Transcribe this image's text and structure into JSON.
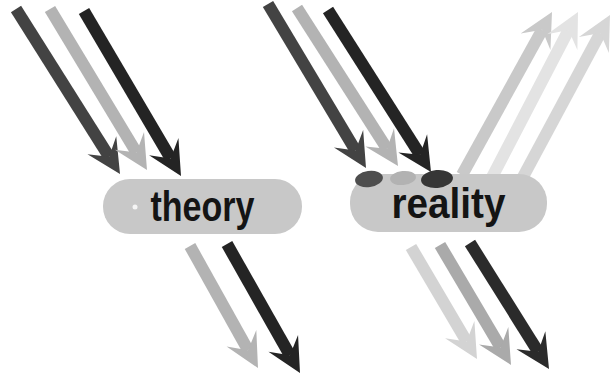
{
  "diagram": {
    "title_present": false,
    "background_color": "#ffffff",
    "nodes": [
      {
        "id": "theory",
        "label": "theory",
        "x": 103,
        "y": 179,
        "width": 199,
        "height": 55,
        "corner_radius": 27,
        "fill": "#c8c8c8",
        "text_color": "#141414",
        "label_width_px": 104,
        "font_px": 42
      },
      {
        "id": "reality",
        "label": "reality",
        "x": 350,
        "y": 174,
        "width": 197,
        "height": 58,
        "corner_radius": 28,
        "fill": "#c8c8c8",
        "text_color": "#141414",
        "label_width_px": 114,
        "font_px": 42
      }
    ],
    "arrow_style": {
      "shaft_width": 12,
      "head_length": 34,
      "head_width": 34,
      "notch_ratio": 0.6
    },
    "arrows": [
      {
        "name": "theory-incoming-arrow-1",
        "group": "theory-incoming",
        "color": "#434343",
        "from": [
          16,
          9
        ],
        "to": [
          120,
          174
        ]
      },
      {
        "name": "theory-incoming-arrow-2",
        "group": "theory-incoming",
        "color": "#b3b3b3",
        "from": [
          50,
          9
        ],
        "to": [
          147,
          170
        ]
      },
      {
        "name": "theory-incoming-arrow-3",
        "group": "theory-incoming",
        "color": "#242424",
        "from": [
          84,
          11
        ],
        "to": [
          181,
          176
        ]
      },
      {
        "name": "theory-outgoing-arrow-1",
        "group": "theory-outgoing",
        "color": "#b3b3b3",
        "from": [
          190,
          246
        ],
        "to": [
          258,
          368
        ]
      },
      {
        "name": "theory-outgoing-arrow-2",
        "group": "theory-outgoing",
        "color": "#242424",
        "from": [
          227,
          244
        ],
        "to": [
          300,
          373
        ]
      },
      {
        "name": "reality-incoming-arrow-1",
        "group": "reality-incoming",
        "color": "#434343",
        "from": [
          268,
          4
        ],
        "to": [
          366,
          168
        ]
      },
      {
        "name": "reality-incoming-arrow-2",
        "group": "reality-incoming",
        "color": "#b3b3b3",
        "from": [
          297,
          8
        ],
        "to": [
          398,
          166
        ]
      },
      {
        "name": "reality-incoming-arrow-3",
        "group": "reality-incoming",
        "color": "#242424",
        "from": [
          328,
          10
        ],
        "to": [
          431,
          172
        ]
      },
      {
        "name": "reality-reflected-arrow-1",
        "group": "reality-reflected",
        "color": "#c9c9c9",
        "from": [
          462,
          175
        ],
        "to": [
          552,
          12
        ]
      },
      {
        "name": "reality-reflected-arrow-2",
        "group": "reality-reflected",
        "color": "#e3e3e3",
        "from": [
          489,
          183
        ],
        "to": [
          578,
          12
        ]
      },
      {
        "name": "reality-reflected-arrow-3",
        "group": "reality-reflected",
        "color": "#d6d6d6",
        "from": [
          516,
          190
        ],
        "to": [
          610,
          15
        ]
      },
      {
        "name": "reality-outgoing-arrow-1",
        "group": "reality-outgoing",
        "color": "#d3d3d3",
        "from": [
          411,
          247
        ],
        "to": [
          477,
          359
        ]
      },
      {
        "name": "reality-outgoing-arrow-2",
        "group": "reality-outgoing",
        "color": "#aaaaaa",
        "from": [
          440,
          245
        ],
        "to": [
          511,
          365
        ]
      },
      {
        "name": "reality-outgoing-arrow-3",
        "group": "reality-outgoing",
        "color": "#2b2b2b",
        "from": [
          470,
          243
        ],
        "to": [
          549,
          369
        ]
      }
    ],
    "splats": [
      {
        "name": "impact-splat-1",
        "cx": 369,
        "cy": 179,
        "rx": 14,
        "ry": 8,
        "rotate": -8,
        "color": "#4e4e4e"
      },
      {
        "name": "impact-splat-2",
        "cx": 403,
        "cy": 178,
        "rx": 13,
        "ry": 7,
        "rotate": -6,
        "color": "#b2b2b2"
      },
      {
        "name": "impact-splat-3",
        "cx": 437,
        "cy": 179,
        "rx": 16,
        "ry": 9,
        "rotate": -5,
        "color": "#363636"
      }
    ],
    "speck": {
      "cx": 135,
      "cy": 207,
      "r": 2.5,
      "color": "#f5f5f5"
    }
  }
}
